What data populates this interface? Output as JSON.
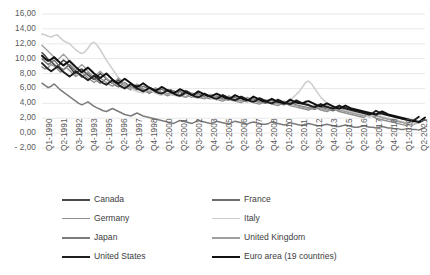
{
  "chart_data": {
    "type": "line",
    "title": "",
    "subtitle": "",
    "xlabel": "",
    "ylabel": "",
    "grid": "horizontal",
    "legend_position": "bottom",
    "ylim": [
      -2,
      16
    ],
    "ytick_step": 2,
    "ytick_labels": [
      "16,00",
      "14,00",
      "12,00",
      "10,00",
      "8,00",
      "6,00",
      "4,00",
      "2,00",
      "0,00",
      "- 2,00"
    ],
    "ytick_values": [
      16,
      14,
      12,
      10,
      8,
      6,
      4,
      2,
      0,
      -2
    ],
    "xtick_labels": [
      "Q1-1990",
      "Q2-1991",
      "Q3-1992",
      "Q4-1993",
      "Q1-1995",
      "Q2-1996",
      "Q3-1997",
      "Q4-1998",
      "Q1-2000",
      "Q2-2001",
      "Q3-2002",
      "Q4-2003",
      "Q1-2005",
      "Q2-2006",
      "Q3-2007",
      "Q4-2008",
      "Q1-2010",
      "Q2-2011",
      "Q3-2012",
      "Q4-2013",
      "Q1-2015",
      "Q2-2016",
      "Q3-2017",
      "Q4-2018",
      "Q1-2020",
      "Q2-2021"
    ],
    "x_start_label": "Q1-1990",
    "x_end_label": "Q2-2021",
    "x_points": 126,
    "series": [
      {
        "name": "Canada",
        "color": "#4a4a4a",
        "width": 1.6,
        "values": [
          10.8,
          10.4,
          9.9,
          9.6,
          9.2,
          8.8,
          9.4,
          9.8,
          9.5,
          8.9,
          8.4,
          8.0,
          8.4,
          8.6,
          8.2,
          7.8,
          7.5,
          7.2,
          7.6,
          8.0,
          7.7,
          7.3,
          7.0,
          6.7,
          6.9,
          7.2,
          6.9,
          6.6,
          6.3,
          6.0,
          6.2,
          6.5,
          6.2,
          5.9,
          5.6,
          5.4,
          5.6,
          5.8,
          5.6,
          5.3,
          5.2,
          5.5,
          5.8,
          5.6,
          5.3,
          5.1,
          5.4,
          5.7,
          5.5,
          5.2,
          5.0,
          4.8,
          5.0,
          5.3,
          5.1,
          4.9,
          4.7,
          4.5,
          4.8,
          5.1,
          4.9,
          4.7,
          4.5,
          4.4,
          4.6,
          4.9,
          4.7,
          4.5,
          4.3,
          4.2,
          4.4,
          4.6,
          4.5,
          4.3,
          4.1,
          4.0,
          4.2,
          4.4,
          4.2,
          4.0,
          3.9,
          3.8,
          4.0,
          4.2,
          4.1,
          3.9,
          3.8,
          3.7,
          3.6,
          3.5,
          3.4,
          3.3,
          3.5,
          3.6,
          3.4,
          3.3,
          3.2,
          3.1,
          3.3,
          3.4,
          3.3,
          3.1,
          3.0,
          2.9,
          2.8,
          2.7,
          2.6,
          2.5,
          2.4,
          2.3,
          2.5,
          2.7,
          2.6,
          2.4,
          2.3,
          2.2,
          2.1,
          2.0,
          1.9,
          1.8,
          1.7,
          1.6,
          1.5,
          1.4,
          1.6,
          1.8
        ]
      },
      {
        "name": "France",
        "color": "#6e6e6e",
        "width": 1.4,
        "values": [
          10.0,
          9.6,
          9.2,
          9.5,
          9.8,
          9.3,
          8.8,
          8.5,
          8.9,
          9.2,
          8.7,
          8.3,
          7.9,
          7.5,
          7.8,
          8.1,
          7.7,
          7.4,
          7.0,
          6.7,
          7.0,
          7.3,
          7.0,
          6.7,
          6.4,
          6.2,
          6.5,
          6.8,
          6.5,
          6.2,
          6.0,
          5.8,
          6.0,
          6.3,
          6.1,
          5.8,
          5.6,
          5.4,
          5.6,
          5.9,
          5.7,
          5.4,
          5.2,
          5.1,
          5.3,
          5.6,
          5.4,
          5.2,
          5.0,
          4.8,
          5.0,
          5.3,
          5.1,
          4.9,
          4.7,
          4.6,
          4.8,
          5.0,
          4.8,
          4.6,
          4.5,
          4.4,
          4.6,
          4.8,
          4.6,
          4.4,
          4.3,
          4.2,
          4.4,
          4.6,
          4.4,
          4.2,
          4.1,
          4.0,
          4.2,
          4.4,
          4.2,
          4.0,
          3.9,
          3.8,
          4.0,
          4.2,
          4.0,
          3.8,
          3.7,
          3.6,
          3.5,
          3.4,
          3.3,
          3.2,
          3.4,
          3.6,
          3.4,
          3.2,
          3.1,
          3.0,
          3.2,
          3.4,
          3.2,
          3.0,
          2.9,
          2.8,
          2.7,
          2.6,
          2.5,
          2.4,
          2.3,
          2.2,
          2.4,
          2.5,
          2.3,
          2.1,
          2.0,
          1.9,
          1.8,
          1.7,
          1.6,
          1.5,
          1.4,
          1.3,
          1.2,
          1.1,
          1.3,
          1.5
        ]
      },
      {
        "name": "Germany",
        "color": "#8f8f8f",
        "width": 1.4,
        "values": [
          8.9,
          8.6,
          8.8,
          9.2,
          9.0,
          8.6,
          8.2,
          8.5,
          8.8,
          8.4,
          8.0,
          7.6,
          7.9,
          8.2,
          7.8,
          7.4,
          7.1,
          6.8,
          7.1,
          7.4,
          7.1,
          6.8,
          6.5,
          6.3,
          6.6,
          6.9,
          6.6,
          6.3,
          6.0,
          5.8,
          6.0,
          6.3,
          6.0,
          5.8,
          5.6,
          5.4,
          5.6,
          5.9,
          5.6,
          5.4,
          5.2,
          5.0,
          5.2,
          5.5,
          5.3,
          5.1,
          4.9,
          4.8,
          5.0,
          5.2,
          5.0,
          4.8,
          4.7,
          4.6,
          4.8,
          5.0,
          4.8,
          4.6,
          4.4,
          4.3,
          4.5,
          4.7,
          4.5,
          4.3,
          4.2,
          4.1,
          4.3,
          4.5,
          4.3,
          4.1,
          4.0,
          3.9,
          4.1,
          4.3,
          4.1,
          3.9,
          3.8,
          3.7,
          3.9,
          4.1,
          3.9,
          3.7,
          3.6,
          3.5,
          3.4,
          3.3,
          3.2,
          3.1,
          3.3,
          3.5,
          3.3,
          3.1,
          3.0,
          2.9,
          3.1,
          3.3,
          3.1,
          2.9,
          2.8,
          2.7,
          2.6,
          2.5,
          2.4,
          2.3,
          2.2,
          2.1,
          2.3,
          2.4,
          2.2,
          2.0,
          1.9,
          1.8,
          1.7,
          1.6,
          1.5,
          1.4,
          1.3,
          1.2,
          1.1,
          1.0,
          1.2,
          1.4
        ]
      },
      {
        "name": "Italy",
        "color": "#cfcfcf",
        "width": 1.6,
        "values": [
          13.3,
          13.2,
          13.0,
          12.9,
          13.1,
          13.2,
          12.8,
          12.4,
          12.2,
          12.0,
          11.6,
          11.2,
          10.9,
          10.7,
          10.9,
          11.4,
          12.0,
          12.2,
          11.8,
          11.2,
          10.5,
          9.8,
          9.2,
          8.6,
          8.0,
          7.4,
          7.0,
          6.6,
          6.3,
          6.0,
          5.8,
          5.6,
          5.5,
          5.4,
          5.6,
          5.8,
          5.6,
          5.4,
          5.2,
          5.1,
          5.3,
          5.5,
          5.3,
          5.1,
          5.0,
          4.9,
          5.1,
          5.3,
          5.1,
          4.9,
          4.8,
          4.7,
          4.9,
          5.1,
          4.9,
          4.7,
          4.6,
          4.5,
          4.7,
          4.9,
          4.7,
          4.5,
          4.4,
          4.3,
          4.5,
          4.7,
          4.5,
          4.3,
          4.2,
          4.1,
          4.3,
          4.5,
          4.4,
          4.2,
          4.1,
          4.0,
          4.2,
          4.4,
          4.2,
          4.1,
          4.0,
          4.4,
          4.8,
          5.2,
          5.6,
          6.2,
          6.8,
          7.0,
          6.6,
          6.0,
          5.4,
          4.8,
          4.4,
          4.0,
          3.7,
          3.5,
          3.3,
          3.2,
          3.1,
          3.0,
          2.9,
          2.8,
          2.7,
          2.6,
          2.5,
          2.4,
          2.3,
          2.2,
          2.4,
          2.6,
          2.4,
          2.2,
          2.1,
          2.0,
          1.9,
          1.8,
          1.7,
          1.6,
          1.5,
          1.4,
          1.3,
          1.2,
          1.4,
          1.6
        ]
      },
      {
        "name": "Japan",
        "color": "#7b7b7b",
        "width": 1.5,
        "values": [
          6.7,
          6.4,
          6.1,
          6.3,
          6.6,
          6.2,
          5.8,
          5.5,
          5.2,
          4.9,
          4.6,
          4.3,
          4.0,
          3.8,
          4.0,
          4.2,
          3.9,
          3.6,
          3.4,
          3.2,
          3.0,
          2.9,
          3.1,
          3.3,
          3.1,
          2.9,
          2.7,
          2.5,
          2.4,
          2.3,
          2.5,
          2.7,
          2.5,
          2.3,
          2.2,
          2.1,
          2.0,
          1.9,
          1.8,
          1.7,
          1.6,
          1.5,
          1.4,
          1.3,
          1.5,
          1.7,
          1.6,
          1.5,
          1.4,
          1.3,
          1.5,
          1.7,
          1.6,
          1.5,
          1.4,
          1.3,
          1.4,
          1.6,
          1.5,
          1.4,
          1.3,
          1.2,
          1.4,
          1.6,
          1.5,
          1.4,
          1.3,
          1.2,
          1.4,
          1.5,
          1.4,
          1.3,
          1.2,
          1.2,
          1.3,
          1.5,
          1.4,
          1.3,
          1.2,
          1.1,
          1.2,
          1.4,
          1.3,
          1.2,
          1.1,
          1.1,
          1.2,
          1.3,
          1.2,
          1.1,
          1.0,
          1.0,
          1.1,
          1.2,
          1.1,
          1.0,
          0.9,
          0.9,
          1.0,
          1.1,
          1.0,
          0.9,
          0.8,
          0.8,
          0.9,
          1.0,
          0.9,
          0.8,
          0.8,
          0.7,
          0.8,
          0.9,
          0.8,
          0.7,
          0.7,
          0.6,
          0.6,
          0.5,
          0.5,
          0.6,
          0.6,
          0.5,
          0.5,
          0.4,
          0.6,
          0.8
        ]
      },
      {
        "name": "United Kingdom",
        "color": "#a0a0a0",
        "width": 1.4,
        "values": [
          11.8,
          11.4,
          11.0,
          10.6,
          10.2,
          9.8,
          10.2,
          10.6,
          10.2,
          9.6,
          9.0,
          8.5,
          8.8,
          9.2,
          8.8,
          8.3,
          7.9,
          7.5,
          7.9,
          8.3,
          7.9,
          7.4,
          7.0,
          6.7,
          7.0,
          7.4,
          7.0,
          6.6,
          6.3,
          6.0,
          6.3,
          6.6,
          6.3,
          6.0,
          5.7,
          5.5,
          5.8,
          6.1,
          5.8,
          5.5,
          5.3,
          5.2,
          5.4,
          5.7,
          5.4,
          5.2,
          5.0,
          4.9,
          5.1,
          5.4,
          5.2,
          5.0,
          4.8,
          4.7,
          4.9,
          5.2,
          5.0,
          4.8,
          4.6,
          4.5,
          4.7,
          5.0,
          4.8,
          4.6,
          4.4,
          4.3,
          4.5,
          4.8,
          4.6,
          4.4,
          4.2,
          4.1,
          4.3,
          4.5,
          4.3,
          4.1,
          4.0,
          3.9,
          4.1,
          4.3,
          4.1,
          3.9,
          3.8,
          3.7,
          3.6,
          3.5,
          3.4,
          3.3,
          3.5,
          3.7,
          3.5,
          3.3,
          3.2,
          3.1,
          3.3,
          3.5,
          3.3,
          3.1,
          3.0,
          2.9,
          2.8,
          2.7,
          2.6,
          2.5,
          2.4,
          2.3,
          2.5,
          2.7,
          2.5,
          2.3,
          2.2,
          2.1,
          2.0,
          1.9,
          1.8,
          1.7,
          1.6,
          1.5,
          1.4,
          1.3,
          1.5,
          1.7
        ]
      },
      {
        "name": "United States",
        "color": "#1f1f1f",
        "width": 1.9,
        "values": [
          9.4,
          9.0,
          8.6,
          8.3,
          8.6,
          9.0,
          8.6,
          8.2,
          7.9,
          7.6,
          7.9,
          8.3,
          8.0,
          7.7,
          7.4,
          7.1,
          7.4,
          7.7,
          7.4,
          7.0,
          6.7,
          6.5,
          6.8,
          7.1,
          6.8,
          6.5,
          6.2,
          6.0,
          6.3,
          6.6,
          6.3,
          6.0,
          5.8,
          5.6,
          5.8,
          6.1,
          5.9,
          5.6,
          5.4,
          5.3,
          5.5,
          5.8,
          5.6,
          5.3,
          5.1,
          5.0,
          5.2,
          5.5,
          5.3,
          5.1,
          4.9,
          4.8,
          5.0,
          5.3,
          5.1,
          4.9,
          4.7,
          4.6,
          4.8,
          5.1,
          4.9,
          4.7,
          4.5,
          4.4,
          4.6,
          4.9,
          4.7,
          4.5,
          4.3,
          4.2,
          4.4,
          4.7,
          4.5,
          4.3,
          4.1,
          4.0,
          4.2,
          4.5,
          4.3,
          4.1,
          4.0,
          3.9,
          4.1,
          4.4,
          4.2,
          4.0,
          3.9,
          3.8,
          3.6,
          3.5,
          3.7,
          3.9,
          3.7,
          3.5,
          3.4,
          3.3,
          3.5,
          3.7,
          3.5,
          3.3,
          3.2,
          3.1,
          3.0,
          2.9,
          2.8,
          2.7,
          2.6,
          2.5,
          2.7,
          3.0,
          2.8,
          2.6,
          2.5,
          2.4,
          2.3,
          2.2,
          2.1,
          2.0,
          1.9,
          1.8,
          1.7,
          1.6,
          1.9,
          2.2
        ]
      },
      {
        "name": "Euro area (19 countries)",
        "color": "#111111",
        "width": 2.0,
        "values": [
          10.4,
          10.0,
          9.7,
          9.9,
          10.2,
          9.8,
          9.4,
          9.1,
          9.4,
          9.7,
          9.3,
          8.9,
          8.5,
          8.2,
          8.5,
          8.8,
          8.4,
          8.0,
          7.7,
          7.4,
          7.7,
          8.0,
          7.6,
          7.2,
          6.9,
          6.7,
          7.0,
          7.3,
          7.0,
          6.7,
          6.4,
          6.2,
          6.4,
          6.7,
          6.4,
          6.1,
          5.9,
          5.7,
          5.9,
          6.2,
          6.0,
          5.7,
          5.5,
          5.4,
          5.6,
          5.9,
          5.7,
          5.5,
          5.3,
          5.1,
          5.3,
          5.6,
          5.4,
          5.2,
          5.0,
          4.9,
          5.1,
          5.3,
          5.1,
          4.9,
          4.7,
          4.6,
          4.8,
          5.1,
          4.9,
          4.7,
          4.5,
          4.4,
          4.6,
          4.9,
          4.7,
          4.5,
          4.3,
          4.2,
          4.4,
          4.6,
          4.4,
          4.2,
          4.1,
          4.0,
          4.2,
          4.5,
          4.3,
          4.1,
          4.0,
          4.0,
          4.2,
          4.3,
          4.1,
          3.9,
          3.7,
          3.6,
          3.8,
          4.0,
          3.8,
          3.6,
          3.4,
          3.3,
          3.5,
          3.7,
          3.5,
          3.3,
          3.2,
          3.1,
          3.0,
          2.9,
          2.8,
          2.7,
          2.6,
          2.5,
          2.7,
          2.9,
          2.7,
          2.5,
          2.4,
          2.3,
          2.2,
          2.1,
          2.0,
          1.9,
          1.8,
          1.7,
          1.6,
          1.5,
          1.8,
          2.1
        ]
      }
    ]
  },
  "legend": {
    "items": [
      {
        "label": "Canada",
        "color": "#4a4a4a",
        "width": 2.0
      },
      {
        "label": "France",
        "color": "#6e6e6e",
        "width": 2.0
      },
      {
        "label": "Germany",
        "color": "#8f8f8f",
        "width": 1.8
      },
      {
        "label": "Italy",
        "color": "#cfcfcf",
        "width": 1.8
      },
      {
        "label": "Japan",
        "color": "#7b7b7b",
        "width": 2.0
      },
      {
        "label": "United Kingdom",
        "color": "#a0a0a0",
        "width": 2.0
      },
      {
        "label": "United States",
        "color": "#1f1f1f",
        "width": 2.6
      },
      {
        "label": "Euro area (19 countries)",
        "color": "#111111",
        "width": 2.8
      }
    ]
  },
  "style": {
    "grid_color": "#e2e2e2",
    "tick_text_color": "#5a5a5a",
    "legend_text_color": "#3d3d3d",
    "background": "#ffffff"
  }
}
